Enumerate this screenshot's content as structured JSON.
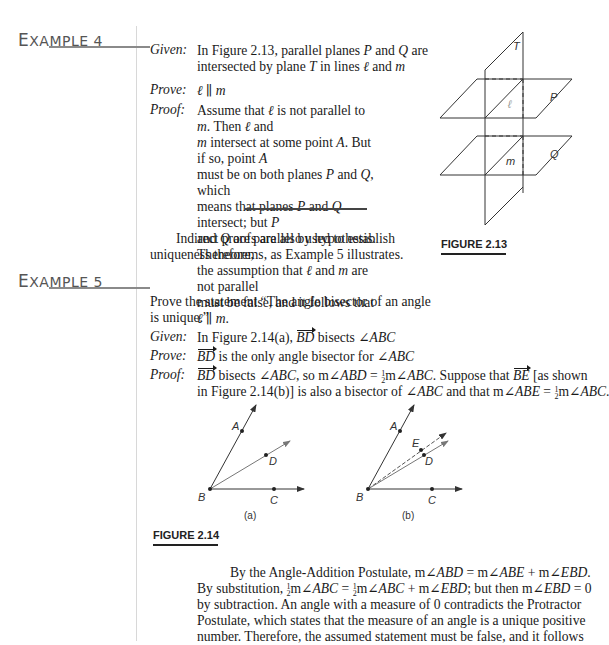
{
  "example4": {
    "heading_first": "E",
    "heading_rest": "XAMPLE 4",
    "given_label": "Given:",
    "given_text_1": "In Figure 2.13, parallel planes P and Q are",
    "given_text_2": "intersected by plane T in lines ℓ and m",
    "prove_label": "Prove:",
    "prove_text": "ℓ ∥ m",
    "proof_label": "Proof:",
    "proof_lines": [
      "Assume that ℓ is not parallel to m. Then ℓ and",
      "m intersect at some point A. But if so, point A",
      "must be on both planes P and Q, which",
      "means that planes P and Q intersect; but P",
      "and Q are parallel by hypothesis. Therefore,",
      "the assumption that ℓ and m are not parallel",
      "must be false, and it follows that ℓ ∥ m."
    ]
  },
  "intro_paragraph": {
    "line1": "Indirect proofs are also used to establish",
    "line2": "uniqueness theorems, as Example 5 illustrates."
  },
  "figure_2_13": {
    "caption": "FIGURE 2.13",
    "labels": {
      "plane_T": "T",
      "plane_P": "P",
      "plane_Q": "Q",
      "line_l": "ℓ",
      "line_m": "m"
    }
  },
  "example5": {
    "heading_first": "E",
    "heading_rest": "XAMPLE 5",
    "statement_1": "Prove the statement “The angle bisector of an angle",
    "statement_2": "is unique.”",
    "given_label": "Given:",
    "given_text": "In Figure 2.14(a), BD bisects ∠ABC",
    "prove_label": "Prove:",
    "prove_text": "BD is the only angle bisector for ∠ABC",
    "proof_label": "Proof:",
    "proof_line1": "BD bisects ∠ABC, so m∠ABD = ½m∠ABC. Suppose that BE [as shown",
    "proof_line2": "in Figure 2.14(b)] is also a bisector of ∠ABC and that m∠ABE = ½m∠ABC."
  },
  "figure_2_14": {
    "caption": "FIGURE 2.14",
    "sub_a": "(a)",
    "sub_b": "(b)",
    "points": {
      "A": "A",
      "B": "B",
      "C": "C",
      "D": "D",
      "E": "E"
    }
  },
  "conclusion": {
    "lines": [
      "By the Angle-Addition Postulate, m∠ABD = m∠ABE + m∠EBD.",
      "By substitution, ½m∠ABC = ½m∠ABC + m∠EBD; but then m∠EBD = 0",
      "by subtraction. An angle with a measure of 0 contradicts the Protractor",
      "Postulate, which states that the measure of an angle is a unique positive",
      "number. Therefore, the assumed statement must be false, and it follows"
    ]
  }
}
